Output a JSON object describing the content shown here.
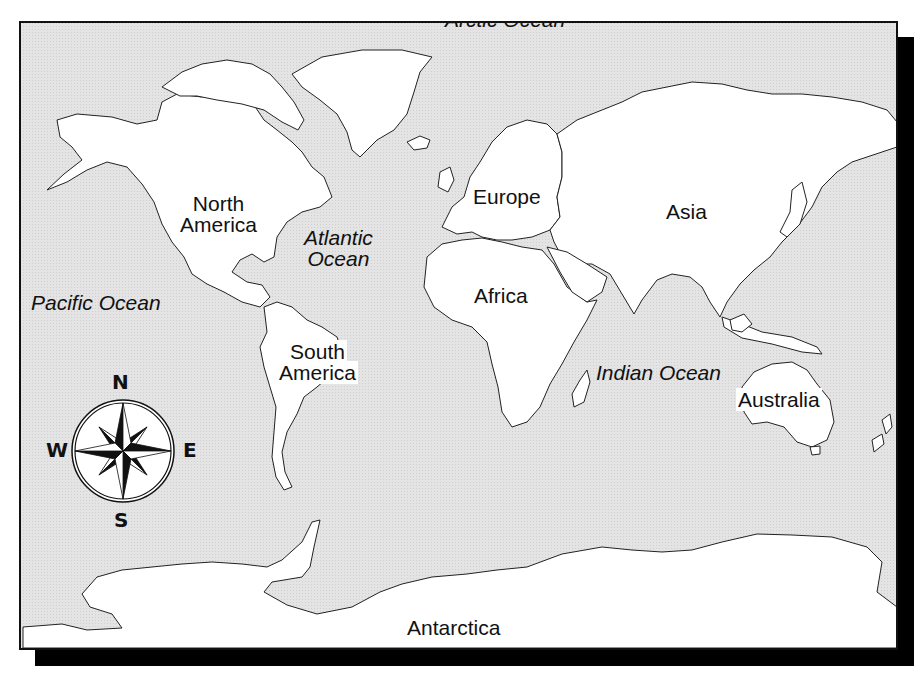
{
  "map": {
    "title": "World Map",
    "colors": {
      "ocean": "#e4e4e4",
      "land": "#ffffff",
      "outline": "#222222",
      "frame": "#111111",
      "shadow": "#000000"
    },
    "continents": [
      {
        "id": "north-america",
        "label_line1": "North",
        "label_line2": "America"
      },
      {
        "id": "south-america",
        "label_line1": "South",
        "label_line2": "America"
      },
      {
        "id": "europe",
        "label": "Europe"
      },
      {
        "id": "asia",
        "label": "Asia"
      },
      {
        "id": "africa",
        "label": "Africa"
      },
      {
        "id": "australia",
        "label": "Australia"
      },
      {
        "id": "antarctica",
        "label": "Antarctica"
      }
    ],
    "oceans": [
      {
        "id": "arctic",
        "label": "Arctic Ocean"
      },
      {
        "id": "atlantic",
        "label_line1": "Atlantic",
        "label_line2": "Ocean"
      },
      {
        "id": "pacific",
        "label": "Pacific Ocean"
      },
      {
        "id": "indian",
        "label": "Indian Ocean"
      }
    ],
    "compass": {
      "north": "N",
      "south": "S",
      "east": "E",
      "west": "W"
    }
  }
}
